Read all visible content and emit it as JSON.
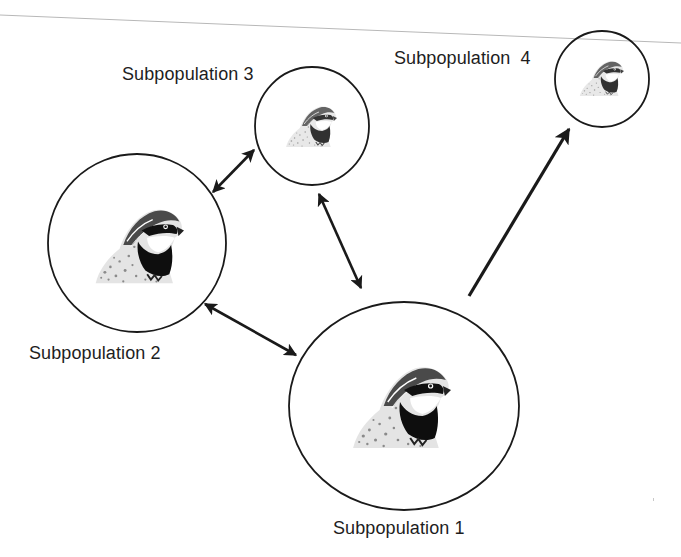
{
  "diagram": {
    "type": "metapopulation",
    "nodes": [
      {
        "id": "sub1",
        "label": "Subpopulation 1",
        "cx": 404,
        "cy": 406,
        "rx": 115,
        "ry": 104,
        "size": "large"
      },
      {
        "id": "sub2",
        "label": "Subpopulation 2",
        "cx": 137,
        "cy": 243,
        "rx": 89,
        "ry": 89,
        "size": "large"
      },
      {
        "id": "sub3",
        "label": "Subpopulation 3",
        "cx": 312,
        "cy": 126,
        "rx": 57,
        "ry": 59,
        "size": "small"
      },
      {
        "id": "sub4",
        "label": "Subpopulation  4",
        "cx": 602,
        "cy": 79,
        "rx": 47,
        "ry": 48,
        "size": "small"
      }
    ],
    "edges": [
      {
        "from": "sub3",
        "to": "sub2",
        "direction": "bidirectional"
      },
      {
        "from": "sub3",
        "to": "sub1",
        "direction": "bidirectional"
      },
      {
        "from": "sub2",
        "to": "sub1",
        "direction": "bidirectional"
      },
      {
        "from": "sub1",
        "to": "sub4",
        "direction": "one-way"
      }
    ]
  },
  "labels": {
    "sub1": "Subpopulation 1",
    "sub2": "Subpopulation 2",
    "sub3": "Subpopulation 3",
    "sub4": "Subpopulation  4"
  },
  "colors": {
    "stroke": "#1a1a1a",
    "text": "#1e1e1e",
    "scan_line": "#b8b8b8",
    "background": "#ffffff"
  }
}
